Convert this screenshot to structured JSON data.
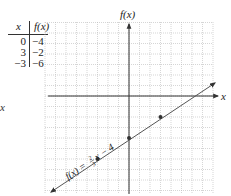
{
  "table": {
    "header_x": "x",
    "header_fx": "f(x)",
    "rows": [
      {
        "x": "0",
        "fx": "−4"
      },
      {
        "x": "3",
        "fx": "−2"
      },
      {
        "x": "−3",
        "fx": "−6"
      }
    ]
  },
  "stray_label": "x",
  "graph": {
    "y_axis_label": "f(x)",
    "x_axis_label": "x",
    "equation_label": "f(x) = ⅔x − 4",
    "equation_prefix": "f(x) = ",
    "equation_num": "2",
    "equation_den": "3",
    "equation_suffix": "x − 4",
    "points": [
      [
        0,
        -4
      ],
      [
        3,
        -2
      ],
      [
        -3,
        -6
      ]
    ],
    "line_color": "#555555",
    "grid_color": "#bbbbbb"
  }
}
